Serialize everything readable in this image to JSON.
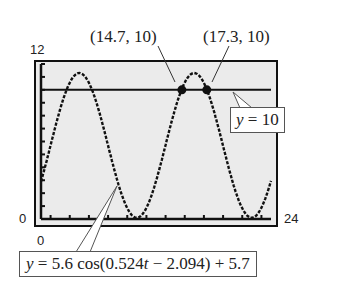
{
  "chart_data": {
    "type": "line",
    "title": "",
    "xlabel": "",
    "ylabel": "",
    "xlim": [
      0,
      24
    ],
    "ylim": [
      0,
      12
    ],
    "grid": false,
    "x_tick_count": 24,
    "y_tick_count": 12,
    "axis_labels": {
      "y_max": "12",
      "y_min": "0",
      "x_min": "0",
      "x_max": "24"
    },
    "series": [
      {
        "name": "y = 5.6 cos(0.524t − 2.094) + 5.7",
        "style": "dotted-calculator-curve",
        "amplitude": 5.6,
        "frequency": 0.524,
        "phase": 2.094,
        "vertical_shift": 5.7
      },
      {
        "name": "y = 10",
        "style": "solid-horizontal-line",
        "value": 10
      }
    ],
    "points": [
      {
        "x": 14.7,
        "y": 10,
        "label": "(14.7, 10)"
      },
      {
        "x": 17.3,
        "y": 10,
        "label": "(17.3, 10)"
      }
    ],
    "annotations": [
      {
        "text_prefix": "y",
        "text_rest": " = 10",
        "target": "horizontal-line"
      },
      {
        "text_prefix": "y",
        "text_rest": " = 5.6 cos(0.524",
        "text_var": "t",
        "text_tail": " − 2.094) + 5.7",
        "target": "cosine-curve"
      }
    ]
  },
  "colors": {
    "plot_background": "#ebebeb",
    "frame": "#111111",
    "curve": "#111111",
    "text": "#222222"
  }
}
